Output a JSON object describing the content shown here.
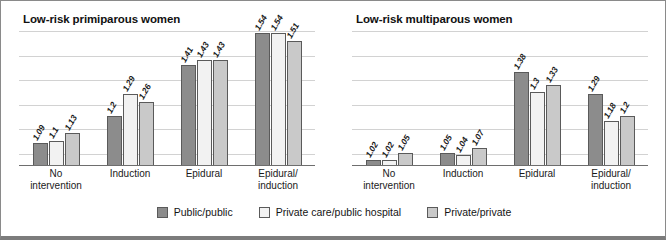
{
  "chart_data": [
    {
      "type": "bar",
      "title": "Low-risk primiparous women",
      "categories": [
        "No intervention",
        "Induction",
        "Epidural",
        "Epidural/ induction"
      ],
      "category_lines": [
        [
          "No",
          "intervention"
        ],
        [
          "Induction",
          ""
        ],
        [
          "Epidural",
          ""
        ],
        [
          "Epidural/",
          "induction"
        ]
      ],
      "series": [
        {
          "name": "Public/public",
          "values": [
            1.09,
            1.2,
            1.41,
            1.54
          ],
          "labels": [
            "1.09",
            "1.2",
            "1.41",
            "1.54"
          ],
          "color": "#8c8c8c"
        },
        {
          "name": "Private care/public hospital",
          "values": [
            1.1,
            1.29,
            1.43,
            1.54
          ],
          "labels": [
            "1.1",
            "1.29",
            "1.43",
            "1.54"
          ],
          "color": "#f2f2f2"
        },
        {
          "name": "Private/private",
          "values": [
            1.13,
            1.26,
            1.43,
            1.51
          ],
          "labels": [
            "1.13",
            "1.26",
            "1.43",
            "1.51"
          ],
          "color": "#c9c9c9"
        }
      ],
      "xlabel": "",
      "ylabel": "",
      "ylim": [
        1.0,
        1.55
      ],
      "gridlines": [
        1.05,
        1.15,
        1.25,
        1.35,
        1.45,
        1.55
      ],
      "grid": true,
      "y_tick_labels_visible": false,
      "legend_position": "bottom"
    },
    {
      "type": "bar",
      "title": "Low-risk multiparous women",
      "categories": [
        "No intervention",
        "Induction",
        "Epidural",
        "Epidural/ induction"
      ],
      "category_lines": [
        [
          "No",
          "intervention"
        ],
        [
          "Induction",
          ""
        ],
        [
          "Epidural",
          ""
        ],
        [
          "Epidural/",
          "induction"
        ]
      ],
      "series": [
        {
          "name": "Public/public",
          "values": [
            1.02,
            1.05,
            1.38,
            1.29
          ],
          "labels": [
            "1.02",
            "1.05",
            "1.38",
            "1.29"
          ],
          "color": "#8c8c8c"
        },
        {
          "name": "Private care/public hospital",
          "values": [
            1.02,
            1.04,
            1.3,
            1.18
          ],
          "labels": [
            "1.02",
            "1.04",
            "1.3",
            "1.18"
          ],
          "color": "#f2f2f2"
        },
        {
          "name": "Private/private",
          "values": [
            1.05,
            1.07,
            1.33,
            1.2
          ],
          "labels": [
            "1.05",
            "1.07",
            "1.33",
            "1.2"
          ],
          "color": "#c9c9c9"
        }
      ],
      "xlabel": "",
      "ylabel": "",
      "ylim": [
        1.0,
        1.55
      ],
      "gridlines": [
        1.05,
        1.15,
        1.25,
        1.35,
        1.45,
        1.55
      ],
      "grid": true,
      "y_tick_labels_visible": false,
      "legend_position": "bottom"
    }
  ],
  "legend": {
    "items": [
      {
        "label": "Public/public",
        "color": "#8c8c8c"
      },
      {
        "label": "Private care/public hospital",
        "color": "#f2f2f2"
      },
      {
        "label": "Private/private",
        "color": "#c9c9c9"
      }
    ]
  }
}
